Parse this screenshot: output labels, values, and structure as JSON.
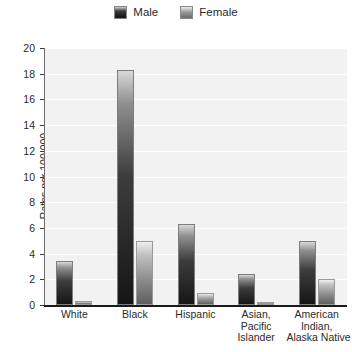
{
  "chart_data": {
    "type": "bar",
    "title": "",
    "xlabel": "",
    "ylabel": "Rates per 100,000",
    "ylim": [
      0,
      20
    ],
    "yticks": [
      0,
      2,
      4,
      6,
      8,
      10,
      12,
      14,
      16,
      18,
      20
    ],
    "ytick_labels": [
      "0",
      "2",
      "4",
      "6",
      "8",
      "10",
      "12",
      "14",
      "16",
      "18",
      "20"
    ],
    "grid": true,
    "legend_position": "top-center",
    "categories": [
      "White",
      "Black",
      "Hispanic",
      "Asian, Pacific Islander",
      "American Indian, Alaska Native"
    ],
    "category_lines": [
      [
        "White"
      ],
      [
        "Black"
      ],
      [
        "Hispanic"
      ],
      [
        "Asian,",
        "Pacific",
        "Islander"
      ],
      [
        "American",
        "Indian,",
        "Alaska Native"
      ]
    ],
    "series": [
      {
        "name": "Male",
        "color": "#151515",
        "values": [
          3.4,
          18.3,
          6.3,
          2.4,
          5.0
        ]
      },
      {
        "name": "Female",
        "color": "#8d8d8d",
        "values": [
          0.3,
          5.0,
          0.9,
          0.2,
          2.0
        ]
      }
    ]
  },
  "legend": {
    "entries": [
      {
        "label": "Male",
        "swatch": "male-swatch"
      },
      {
        "label": "Female",
        "swatch": "female-swatch"
      }
    ]
  },
  "axes": {
    "y_title": "Rates per 100,000"
  },
  "colors": {
    "plot_background": "#f2f2f2",
    "gridline": "#ffffff",
    "axis": "#1a1a1a",
    "text": "#2b2b2b",
    "male_bar_dark": "#151515",
    "female_bar_mid": "#8d8d8d"
  }
}
